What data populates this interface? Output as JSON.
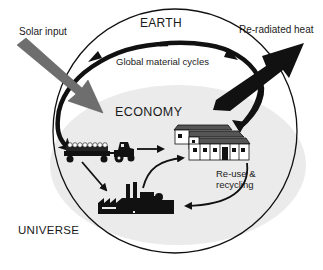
{
  "diagram": {
    "labels": {
      "solar_input": "Solar input",
      "reradiated_heat": "Re-radiated heat",
      "earth": "EARTH",
      "global_material_cycles": "Global material cycles",
      "economy": "ECONOMY",
      "reuse_line1": "Re-use &",
      "reuse_line2": "recycling",
      "universe": "UNIVERSE"
    },
    "nodes": [
      {
        "id": "agriculture",
        "icon": "tractor-with-trailer-icon"
      },
      {
        "id": "housing",
        "icon": "houses-icon"
      },
      {
        "id": "industry",
        "icon": "factory-icon"
      }
    ],
    "edges": [
      {
        "from": "solar_input",
        "into": "economy",
        "style": "wide gray arrow"
      },
      {
        "from": "economy",
        "to": "reradiated_heat",
        "style": "wide black arrow"
      },
      {
        "from": "agriculture",
        "to": "housing"
      },
      {
        "from": "agriculture",
        "to": "industry"
      },
      {
        "from": "industry",
        "to": "housing",
        "label": "Re-use & recycling"
      },
      {
        "from": "housing",
        "to": "industry",
        "label": "Re-use & recycling"
      },
      {
        "from": "earth",
        "to": "agriculture",
        "style": "global material cycle arc (left)"
      },
      {
        "from": "housing",
        "to": "earth",
        "style": "global material cycle arc (right)"
      }
    ],
    "colors": {
      "background": "#ffffff",
      "economy_fill": "#ebebeb",
      "solar_arrow": "#6e6e6e",
      "heat_arrow": "#111111",
      "lines": "#111111"
    }
  }
}
